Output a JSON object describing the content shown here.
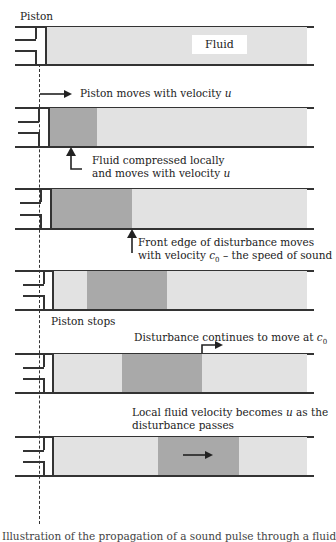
{
  "figure": {
    "title_label": "Piston",
    "fluid_label": "Fluid",
    "stages": [
      {
        "id": 1,
        "annotation": "",
        "disturbance": null
      },
      {
        "id": 2,
        "annotation_above": "Piston moves with velocity u",
        "annotation_below_line1": "Fluid compressed locally",
        "annotation_below_line2": "and moves with velocity u"
      },
      {
        "id": 3,
        "annotation_below_line1": "Front edge of disturbance moves",
        "annotation_below_line2": "with velocity c0 – the speed of sound"
      },
      {
        "id": 4,
        "annotation_below": "Piston stops"
      },
      {
        "id": 5,
        "annotation_above": "Disturbance continues to move at c0"
      },
      {
        "id": 6,
        "annotation_above_line1": "Local fluid velocity becomes u as the",
        "annotation_above_line2": "disturbance passes"
      }
    ],
    "text": {
      "piston": "Piston",
      "fluid": "Fluid",
      "piston_moves_prefix": "Piston moves with velocity ",
      "u": "u",
      "compressed_line1": "Fluid compressed locally",
      "compressed_line2_prefix": "and moves with velocity ",
      "front_edge_line1": "Front edge of disturbance moves",
      "front_edge_line2_prefix": "with velocity ",
      "c": "c",
      "zero": "0",
      "front_edge_line2_suffix": " – the speed of sound",
      "piston_stops": "Piston stops",
      "continues_prefix": "Disturbance continues to move at ",
      "local_line1_prefix": "Local fluid velocity becomes ",
      "local_line1_suffix": " as the",
      "local_line2": "disturbance passes",
      "caption_truncated": "Illustration of the propagation of a sound pulse through a fluid"
    },
    "colors": {
      "line": "#333333",
      "fluid": "#e2e2e2",
      "disturbance": "#a9a9a9",
      "background": "#ffffff"
    }
  }
}
